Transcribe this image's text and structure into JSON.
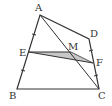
{
  "diagram": {
    "type": "geometry-quadrilateral",
    "colors": {
      "stroke": "#333333",
      "shade": "#c8c8c8",
      "background": "#ffffff"
    },
    "points": {
      "A": {
        "x": 40,
        "y": 15,
        "label": "A",
        "lx": 35,
        "ly": 11
      },
      "B": {
        "x": 17,
        "y": 89,
        "label": "B",
        "lx": 9,
        "ly": 99
      },
      "C": {
        "x": 99,
        "y": 89,
        "label": "C",
        "lx": 98,
        "ly": 99
      },
      "D": {
        "x": 89,
        "y": 39,
        "label": "D",
        "lx": 90,
        "ly": 37
      },
      "E": {
        "x": 29,
        "y": 52,
        "label": "E",
        "lx": 19,
        "ly": 56
      },
      "F": {
        "x": 93,
        "y": 63,
        "label": "F",
        "lx": 96,
        "ly": 66
      },
      "M": {
        "x": 71,
        "y": 52,
        "label": "M",
        "lx": 68,
        "ly": 51
      }
    },
    "segments": [
      "AB",
      "BC",
      "CD",
      "DA",
      "AC",
      "EF",
      "EM"
    ],
    "shaded_region": [
      "E",
      "M",
      "F"
    ],
    "tick_marks": [
      "AE",
      "EB",
      "DF",
      "FC"
    ]
  }
}
